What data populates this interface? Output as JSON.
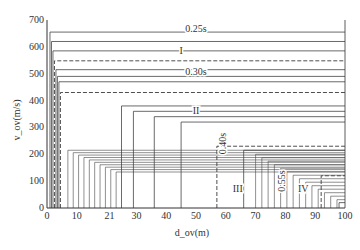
{
  "chart_data": {
    "type": "line",
    "title": "",
    "xlabel": "d_ov(m)",
    "ylabel": "v_ov(m/s)",
    "xlim": [
      0,
      100
    ],
    "ylim": [
      0,
      700
    ],
    "x_ticks": [
      "0",
      "10",
      "21",
      "30",
      "40",
      "50",
      "60",
      "70",
      "80",
      "90",
      "100"
    ],
    "x_tick_values": [
      0,
      10,
      21,
      30,
      40,
      50,
      60,
      70,
      80,
      90,
      100
    ],
    "y_ticks": [
      "0",
      "100",
      "200",
      "300",
      "400",
      "500",
      "600",
      "700"
    ],
    "y_tick_values": [
      0,
      100,
      200,
      300,
      400,
      500,
      600,
      700
    ],
    "grid": false,
    "legend": "none",
    "annotations": [
      {
        "text": "0.25s",
        "x": 50,
        "y": 665
      },
      {
        "text": "I",
        "x": 45,
        "y": 585
      },
      {
        "text": "0.30s",
        "x": 50,
        "y": 505
      },
      {
        "text": "II",
        "x": 50,
        "y": 360
      },
      {
        "text": "0.40s",
        "x": 59,
        "y": 240,
        "rotated": true
      },
      {
        "text": "III",
        "x": 64,
        "y": 70
      },
      {
        "text": "0.55s",
        "x": 79,
        "y": 100,
        "rotated": true
      },
      {
        "text": "IV",
        "x": 86,
        "y": 70
      }
    ],
    "series_description": "Nested step-shaped boundary curves: each curve rises vertically at a given d_ov then runs horizontally to d=100 at a given v_ov level. Dashed curves mark region boundaries I–IV.",
    "series": [
      {
        "name": "curve-1",
        "style": "solid",
        "x_step": 1,
        "v": 655
      },
      {
        "name": "curve-2",
        "style": "solid",
        "x_step": 1.5,
        "v": 620
      },
      {
        "name": "curve-3",
        "style": "solid",
        "x_step": 2,
        "v": 585
      },
      {
        "name": "boundary-I",
        "style": "dashed",
        "x_step": 2.5,
        "v": 548
      },
      {
        "name": "curve-5",
        "style": "solid",
        "x_step": 3,
        "v": 515
      },
      {
        "name": "curve-6",
        "style": "solid",
        "x_step": 3.5,
        "v": 490
      },
      {
        "name": "curve-7",
        "style": "solid",
        "x_step": 4,
        "v": 470
      },
      {
        "name": "boundary-II",
        "style": "dashed",
        "x_step": 4.5,
        "v": 430
      },
      {
        "name": "curve-9",
        "style": "solid",
        "x_step": 25,
        "v": 380
      },
      {
        "name": "curve-10",
        "style": "solid",
        "x_step": 29,
        "v": 360
      },
      {
        "name": "curve-11",
        "style": "solid",
        "x_step": 36,
        "v": 340
      },
      {
        "name": "curve-12",
        "style": "solid",
        "x_step": 45,
        "v": 320
      },
      {
        "name": "boundary-III",
        "style": "dashed",
        "x_step": 57,
        "v": 230
      },
      {
        "name": "curve-14",
        "style": "solid",
        "x_step": 66,
        "v": 215
      },
      {
        "name": "boundary-IV",
        "style": "dashed",
        "x_step": 92,
        "v": 120
      },
      {
        "name": "curve-16",
        "style": "solid",
        "x_step": 98,
        "v": 20
      }
    ]
  }
}
